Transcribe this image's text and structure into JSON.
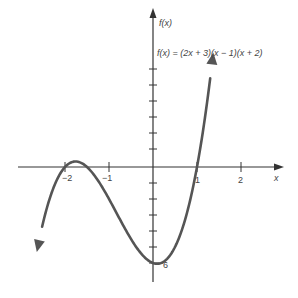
{
  "chart_data": {
    "type": "line",
    "title": "",
    "equation_label": "f(x) = (2x + 3)(x − 1)(x + 2)",
    "xlabel": "x",
    "ylabel": "f(x)",
    "x_ticks": [
      -2,
      -1,
      1,
      2
    ],
    "x_tick_labels": [
      "−2",
      "−1",
      "1",
      "2"
    ],
    "y_annotation": {
      "value": -6,
      "label": "−6"
    },
    "xlim": [
      -3.5,
      3
    ],
    "ylim": [
      -7,
      10
    ],
    "grid": false,
    "function": "(2x+3)(x-1)(x+2)",
    "roots": [
      -2,
      -1.5,
      1
    ],
    "y_intercept": -6,
    "series": [
      {
        "name": "f(x)",
        "x": [
          -2.6,
          -2.4,
          -2.2,
          -2.0,
          -1.8,
          -1.75,
          -1.6,
          -1.5,
          -1.2,
          -1.0,
          -0.8,
          -0.5,
          -0.2,
          0.0,
          0.2,
          0.5,
          0.8,
          1.0,
          1.2,
          1.35
        ],
        "y": [
          -4.75,
          -2.27,
          -0.72,
          0.0,
          0.17,
          0.16,
          0.1,
          0.0,
          -0.78,
          -2.0,
          -3.25,
          -4.5,
          -5.6,
          -6.0,
          -6.1,
          -5.0,
          -2.4,
          0.0,
          2.9,
          6.7
        ]
      }
    ]
  },
  "labels": {
    "y_axis": "f(x)",
    "x_axis": "x",
    "equation": "f(x) = (2x + 3)(x − 1)(x + 2)",
    "tick_neg2": "−2",
    "tick_neg1": "−1",
    "tick_1": "1",
    "tick_2": "2",
    "y_intercept": "6"
  },
  "colors": {
    "curve": "#555555",
    "axes": "#333333"
  }
}
